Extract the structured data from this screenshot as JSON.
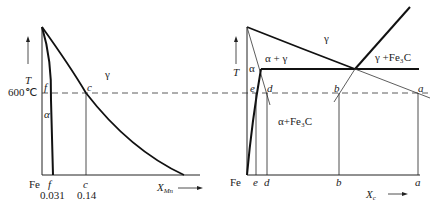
{
  "left_diagram": {
    "axis_y_label": "T",
    "axis_x_label": "X",
    "axis_x_subscript": "Mn",
    "origin_label": "Fe",
    "temperature_label": "600℃",
    "phase_labels": {
      "alpha": "α",
      "gamma": "γ"
    },
    "point_labels": {
      "f_top": "f",
      "c_top": "c",
      "f_bottom": "f",
      "c_bottom": "c"
    },
    "composition_values": {
      "f": "0.031",
      "c": "0.14"
    }
  },
  "right_diagram": {
    "axis_y_label": "T",
    "axis_x_label": "X",
    "axis_x_subscript": "c",
    "origin_label": "Fe",
    "phase_labels": {
      "gamma": "γ",
      "alpha": "α",
      "alpha_gamma": "α + γ",
      "gamma_fe3c": "γ +Fe₃C",
      "alpha_fe3c": "α+Fe₃C"
    },
    "point_labels_top": {
      "e": "e",
      "d": "d",
      "b": "b",
      "a": "a"
    },
    "point_labels_bottom": {
      "e": "e",
      "d": "d",
      "b": "b",
      "a": "a"
    }
  },
  "colors": {
    "line": "#111111",
    "text": "#222222",
    "dash": "#333333"
  }
}
